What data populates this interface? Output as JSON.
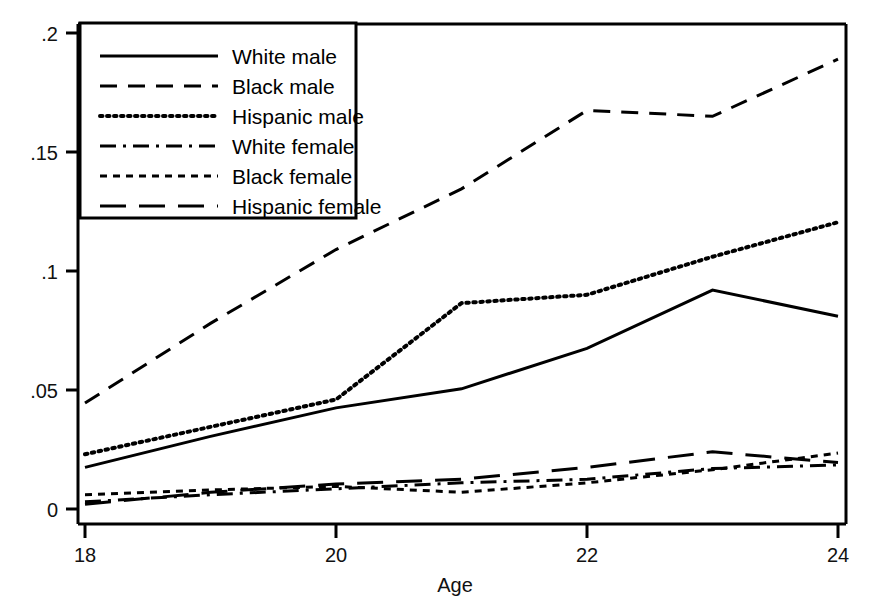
{
  "chart_data": {
    "type": "line",
    "title": "",
    "xlabel": "Age",
    "ylabel": "",
    "xlim": [
      18,
      24
    ],
    "ylim": [
      0,
      0.2
    ],
    "grid": false,
    "legend_position": "top-left",
    "x": [
      18,
      19,
      20,
      21,
      22,
      23,
      24
    ],
    "xticks": [
      "18",
      "20",
      "22",
      "24"
    ],
    "xtick_values": [
      18,
      20,
      22,
      24
    ],
    "yticks": [
      "0",
      ".05",
      ".1",
      ".15",
      ".2"
    ],
    "ytick_values": [
      0,
      0.05,
      0.1,
      0.15,
      0.2
    ],
    "series": [
      {
        "name": "White male",
        "dash": "solid",
        "values": [
          0.0175,
          0.0305,
          0.0425,
          0.0505,
          0.0675,
          0.092,
          0.081
        ]
      },
      {
        "name": "Black male",
        "dash": "dashed",
        "values": [
          0.0445,
          0.078,
          0.109,
          0.1345,
          0.1675,
          0.165,
          0.189
        ]
      },
      {
        "name": "Hispanic male",
        "dash": "dotted",
        "values": [
          0.023,
          0.0345,
          0.046,
          0.0865,
          0.09,
          0.106,
          0.1205
        ]
      },
      {
        "name": "White female",
        "dash": "dash-dot",
        "values": [
          0.003,
          0.006,
          0.0085,
          0.011,
          0.0125,
          0.017,
          0.0185
        ]
      },
      {
        "name": "Black female",
        "dash": "short-dash",
        "values": [
          0.006,
          0.008,
          0.0095,
          0.007,
          0.011,
          0.0165,
          0.0235
        ]
      },
      {
        "name": "Hispanic female",
        "dash": "long-dash",
        "values": [
          0.002,
          0.007,
          0.0105,
          0.0125,
          0.0175,
          0.024,
          0.0195
        ]
      }
    ]
  },
  "legend": {
    "items": [
      {
        "label": "White male"
      },
      {
        "label": "Black male"
      },
      {
        "label": "Hispanic male"
      },
      {
        "label": "White female"
      },
      {
        "label": "Black female"
      },
      {
        "label": "Hispanic female"
      }
    ]
  },
  "axis": {
    "x_title": "Age",
    "y_tick_0": "0",
    "y_tick_1": ".05",
    "y_tick_2": ".1",
    "y_tick_3": ".15",
    "y_tick_4": ".2",
    "x_tick_0": "18",
    "x_tick_1": "20",
    "x_tick_2": "22",
    "x_tick_3": "24"
  },
  "colors": {
    "line": "#000000",
    "axis": "#000000",
    "background": "#ffffff"
  }
}
